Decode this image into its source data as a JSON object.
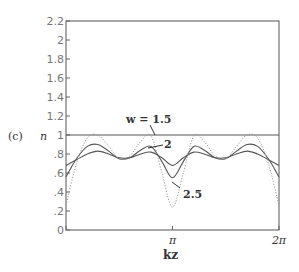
{
  "panel_label": "(c)",
  "ylabel": "n",
  "xlabel": "kz",
  "chart_data": {
    "type": "line",
    "title": "",
    "panel": "(c)",
    "xlabel": "kz",
    "ylabel": "n",
    "xlim": [
      0,
      6.2832
    ],
    "ylim": [
      0,
      2.2
    ],
    "x_tick_labels": [
      "0",
      "π",
      "2π"
    ],
    "y_tick_labels": [
      "0",
      ".2",
      ".4",
      ".6",
      ".8",
      "1",
      "1.2",
      "1.4",
      "1.6",
      "1.8",
      "2",
      "2.2"
    ],
    "grid": false,
    "annotations": [
      "w = 1.5",
      "2",
      "2.5"
    ],
    "x": [
      0,
      0.31,
      0.63,
      0.94,
      1.26,
      1.57,
      1.88,
      2.2,
      2.51,
      2.83,
      3.14,
      3.46,
      3.77,
      4.08,
      4.4,
      4.71,
      5.03,
      5.34,
      5.65,
      5.97,
      6.28
    ],
    "series": [
      {
        "name": "reference n=1",
        "style": "solid",
        "values": [
          1.0,
          1.0,
          1.0,
          1.0,
          1.0,
          1.0,
          1.0,
          1.0,
          1.0,
          1.0,
          1.0,
          1.0,
          1.0,
          1.0,
          1.0,
          1.0,
          1.0,
          1.0,
          1.0,
          1.0,
          1.0
        ]
      },
      {
        "name": "w = 1.5",
        "style": "solid",
        "values": [
          0.68,
          0.74,
          0.8,
          0.83,
          0.8,
          0.76,
          0.76,
          0.8,
          0.82,
          0.76,
          0.68,
          0.76,
          0.82,
          0.8,
          0.76,
          0.76,
          0.8,
          0.83,
          0.8,
          0.74,
          0.68
        ]
      },
      {
        "name": "w = 2",
        "style": "solid",
        "values": [
          0.56,
          0.75,
          0.88,
          0.9,
          0.83,
          0.75,
          0.76,
          0.84,
          0.88,
          0.72,
          0.55,
          0.72,
          0.88,
          0.84,
          0.76,
          0.75,
          0.83,
          0.9,
          0.88,
          0.75,
          0.56
        ]
      },
      {
        "name": "w = 2.5",
        "style": "dotted",
        "values": [
          0.26,
          0.7,
          0.97,
          1.0,
          0.88,
          0.75,
          0.78,
          0.93,
          0.99,
          0.6,
          0.24,
          0.6,
          0.99,
          0.93,
          0.78,
          0.75,
          0.88,
          1.0,
          0.97,
          0.7,
          0.26
        ]
      }
    ]
  }
}
